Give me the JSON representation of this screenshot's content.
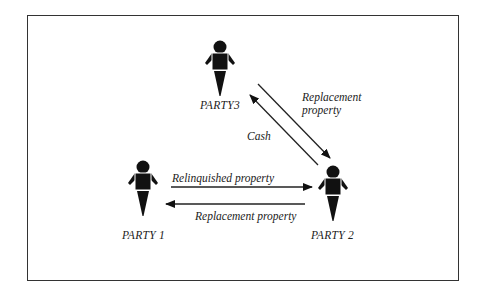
{
  "diagram": {
    "type": "three-party property exchange",
    "parties": [
      {
        "id": "party1",
        "label": "PARTY 1"
      },
      {
        "id": "party2",
        "label": "PARTY 2"
      },
      {
        "id": "party3",
        "label": "PARTY3"
      }
    ],
    "flows": [
      {
        "from": "party1",
        "to": "party2",
        "label": "Relinquished property"
      },
      {
        "from": "party2",
        "to": "party1",
        "label": "Replacement property"
      },
      {
        "from": "party3",
        "to": "party2",
        "label_line1": "Replacement",
        "label_line2": "property"
      },
      {
        "from": "party2",
        "to": "party3",
        "label": "Cash"
      }
    ],
    "colors": {
      "ink": "#111111",
      "frame": "#333333",
      "background": "#ffffff"
    }
  }
}
